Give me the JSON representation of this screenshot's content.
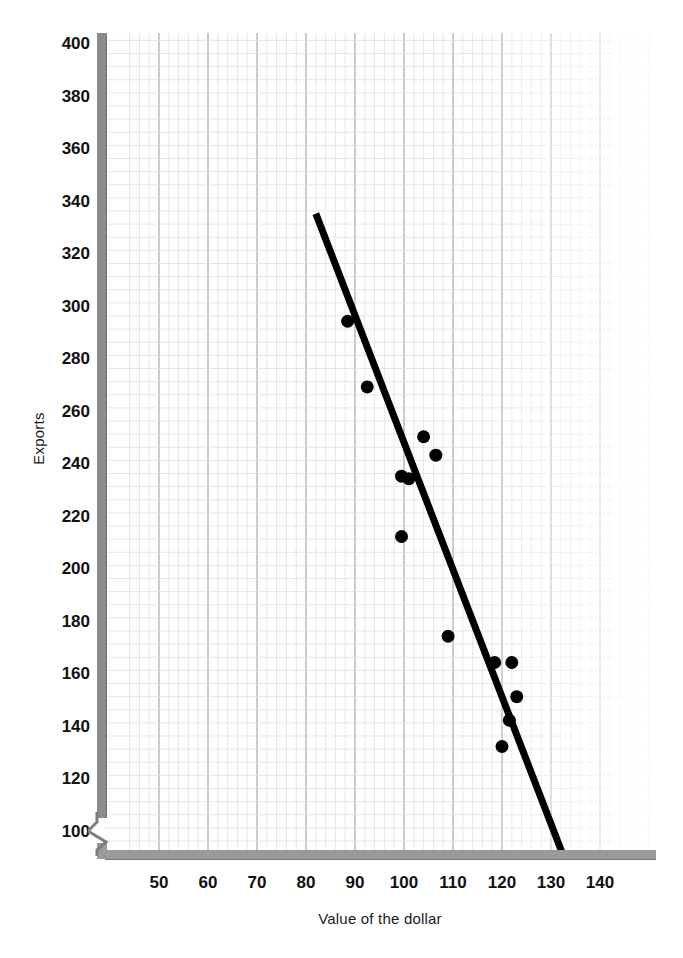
{
  "chart_data": {
    "type": "scatter",
    "title": "",
    "xlabel": "Value of the dollar",
    "ylabel": "Exports",
    "xlim": [
      45,
      150
    ],
    "ylim": [
      88,
      400
    ],
    "grid": true,
    "legend": null,
    "axis_break_y": true,
    "xticks": [
      50,
      60,
      70,
      80,
      90,
      100,
      110,
      120,
      130,
      140
    ],
    "xticklabels": [
      "50",
      "60",
      "70",
      "80",
      "90",
      "100",
      "110",
      "120",
      "130",
      "140"
    ],
    "yticks": [
      100,
      120,
      140,
      160,
      180,
      200,
      220,
      240,
      260,
      280,
      300,
      320,
      340,
      360,
      380,
      400
    ],
    "yticklabels": [
      "100",
      "120",
      "140",
      "160",
      "180",
      "200",
      "220",
      "240",
      "260",
      "280",
      "300",
      "320",
      "340",
      "360",
      "380",
      "400"
    ],
    "marker_color": "#000000",
    "marker_size": 13,
    "points": [
      {
        "x": 88.5,
        "y": 294
      },
      {
        "x": 92.5,
        "y": 269
      },
      {
        "x": 104.0,
        "y": 250
      },
      {
        "x": 106.5,
        "y": 243
      },
      {
        "x": 99.5,
        "y": 235
      },
      {
        "x": 101.0,
        "y": 234
      },
      {
        "x": 99.5,
        "y": 212
      },
      {
        "x": 109.0,
        "y": 174
      },
      {
        "x": 118.5,
        "y": 164
      },
      {
        "x": 122.0,
        "y": 164
      },
      {
        "x": 123.0,
        "y": 151
      },
      {
        "x": 121.5,
        "y": 142
      },
      {
        "x": 120.0,
        "y": 132
      }
    ],
    "trendline": {
      "color": "#000000",
      "width": 7,
      "x0": 82.0,
      "y0": 335,
      "x1": 133.0,
      "y1": 88
    }
  }
}
